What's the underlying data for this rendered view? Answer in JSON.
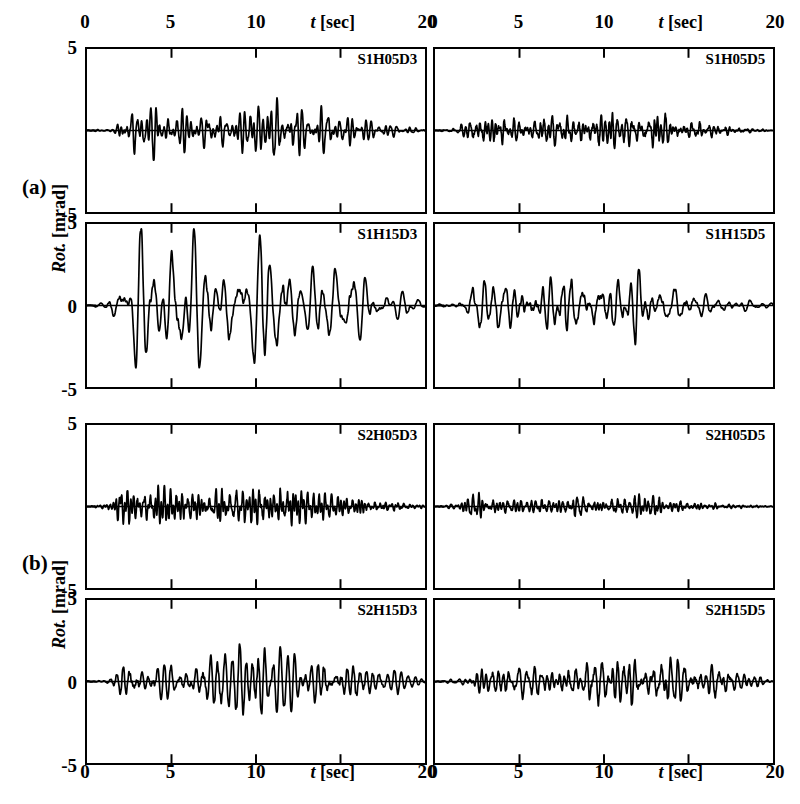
{
  "figure": {
    "width": 800,
    "height": 804,
    "background": "#ffffff",
    "ink_color": "#000000"
  },
  "groups": [
    {
      "id": "a",
      "label": "(a)",
      "x": 22,
      "y": 177
    },
    {
      "id": "b",
      "label": "(b)",
      "x": 22,
      "y": 553
    }
  ],
  "axis_titles": {
    "x_symbol": "t",
    "x_unit": "[sec]",
    "y_symbol": "Rot.",
    "y_unit": "[mrad]"
  },
  "axes": {
    "xlim": [
      0,
      20
    ],
    "ylim": [
      -5,
      5
    ],
    "x_ticks": [
      0,
      5,
      10,
      15,
      20
    ],
    "x_tick_labels": [
      "0",
      "5",
      "10",
      "",
      "20"
    ],
    "y_ticks": [
      -5,
      0,
      5
    ],
    "y_tick_labels_left_row1": [
      "5",
      "",
      "-5"
    ],
    "y_tick_labels_left_row2": [
      "5",
      "0",
      "-5"
    ],
    "y_tick_labels_right": [
      "",
      "",
      ""
    ],
    "grid": false
  },
  "layout": {
    "col_x": [
      85,
      433
    ],
    "col_width": 342,
    "row_y": [
      47,
      222,
      423,
      598
    ],
    "row_height": 167,
    "top_axis_y": 12,
    "bottom_axis_y": 762
  },
  "chart_data": {
    "type": "line",
    "title": "",
    "xlabel": "t [sec]",
    "ylabel": "Rot. [mrad]",
    "xlim": [
      0,
      20
    ],
    "ylim": [
      -5,
      5
    ],
    "grid": false,
    "legend_position": "none",
    "panels": [
      {
        "name": "S1H05D3",
        "group": "a",
        "row": 0,
        "col": 0,
        "series_name": "S1H05D3",
        "peak_amplitude": 2.0,
        "dominant_period_sec": 0.3,
        "envelope": [
          [
            0.0,
            0.02
          ],
          [
            1.5,
            0.05
          ],
          [
            2.0,
            0.55
          ],
          [
            2.6,
            0.95
          ],
          [
            3.2,
            0.7
          ],
          [
            3.8,
            0.95
          ],
          [
            4.4,
            0.6
          ],
          [
            5.2,
            0.55
          ],
          [
            6.0,
            0.65
          ],
          [
            6.8,
            0.55
          ],
          [
            7.6,
            0.7
          ],
          [
            8.4,
            0.5
          ],
          [
            9.0,
            0.75
          ],
          [
            9.8,
            0.85
          ],
          [
            10.6,
            0.65
          ],
          [
            11.2,
            0.9
          ],
          [
            11.8,
            0.65
          ],
          [
            12.6,
            0.8
          ],
          [
            13.4,
            0.6
          ],
          [
            14.2,
            0.75
          ],
          [
            15.0,
            0.45
          ],
          [
            16.0,
            0.35
          ],
          [
            17.0,
            0.25
          ],
          [
            18.0,
            0.18
          ],
          [
            19.0,
            0.12
          ],
          [
            20.0,
            0.06
          ]
        ],
        "seed": 11
      },
      {
        "name": "S1H05D5",
        "group": "a",
        "row": 0,
        "col": 1,
        "series_name": "S1H05D5",
        "peak_amplitude": 1.1,
        "dominant_period_sec": 0.28,
        "envelope": [
          [
            0.0,
            0.02
          ],
          [
            1.2,
            0.08
          ],
          [
            2.0,
            0.45
          ],
          [
            2.8,
            0.75
          ],
          [
            3.4,
            0.55
          ],
          [
            4.0,
            0.85
          ],
          [
            4.8,
            0.45
          ],
          [
            5.6,
            0.5
          ],
          [
            6.4,
            0.6
          ],
          [
            7.2,
            0.55
          ],
          [
            8.0,
            0.6
          ],
          [
            8.8,
            0.55
          ],
          [
            9.6,
            0.8
          ],
          [
            10.4,
            0.7
          ],
          [
            11.2,
            0.75
          ],
          [
            12.0,
            0.6
          ],
          [
            12.8,
            0.85
          ],
          [
            13.6,
            0.55
          ],
          [
            14.4,
            0.5
          ],
          [
            15.2,
            0.4
          ],
          [
            16.2,
            0.28
          ],
          [
            17.2,
            0.18
          ],
          [
            18.2,
            0.12
          ],
          [
            19.2,
            0.08
          ],
          [
            20.0,
            0.04
          ]
        ],
        "seed": 23
      },
      {
        "name": "S1H15D3",
        "group": "a",
        "row": 1,
        "col": 0,
        "series_name": "S1H15D3",
        "peak_amplitude": 4.7,
        "dominant_period_sec": 0.72,
        "envelope": [
          [
            0.0,
            0.02
          ],
          [
            0.8,
            0.06
          ],
          [
            1.4,
            0.18
          ],
          [
            2.0,
            0.3
          ],
          [
            2.6,
            0.62
          ],
          [
            3.2,
            0.78
          ],
          [
            3.8,
            0.98
          ],
          [
            4.4,
            0.85
          ],
          [
            5.0,
            0.72
          ],
          [
            5.6,
            0.8
          ],
          [
            6.2,
            0.7
          ],
          [
            6.8,
            0.58
          ],
          [
            7.4,
            0.6
          ],
          [
            8.0,
            0.62
          ],
          [
            8.6,
            0.66
          ],
          [
            9.2,
            0.78
          ],
          [
            9.8,
            0.8
          ],
          [
            10.4,
            0.92
          ],
          [
            11.0,
            0.84
          ],
          [
            11.6,
            0.78
          ],
          [
            12.2,
            0.58
          ],
          [
            12.8,
            0.4
          ],
          [
            13.4,
            0.62
          ],
          [
            14.0,
            0.7
          ],
          [
            14.6,
            0.6
          ],
          [
            15.2,
            0.52
          ],
          [
            15.8,
            0.48
          ],
          [
            16.4,
            0.4
          ],
          [
            17.2,
            0.3
          ],
          [
            18.0,
            0.22
          ],
          [
            19.0,
            0.14
          ],
          [
            20.0,
            0.07
          ]
        ],
        "seed": 7
      },
      {
        "name": "S1H15D5",
        "group": "a",
        "row": 1,
        "col": 1,
        "series_name": "S1H15D5",
        "peak_amplitude": 2.4,
        "dominant_period_sec": 0.62,
        "envelope": [
          [
            0.0,
            0.02
          ],
          [
            1.0,
            0.08
          ],
          [
            1.8,
            0.2
          ],
          [
            2.4,
            0.48
          ],
          [
            3.0,
            0.62
          ],
          [
            3.6,
            0.72
          ],
          [
            4.2,
            0.55
          ],
          [
            4.8,
            0.48
          ],
          [
            5.4,
            0.62
          ],
          [
            6.0,
            0.68
          ],
          [
            6.6,
            0.6
          ],
          [
            7.2,
            0.72
          ],
          [
            7.8,
            0.88
          ],
          [
            8.4,
            0.62
          ],
          [
            9.0,
            0.55
          ],
          [
            9.6,
            0.7
          ],
          [
            10.2,
            0.62
          ],
          [
            10.8,
            0.52
          ],
          [
            11.4,
            0.58
          ],
          [
            12.0,
            0.76
          ],
          [
            12.6,
            0.55
          ],
          [
            13.2,
            0.38
          ],
          [
            13.8,
            0.42
          ],
          [
            14.4,
            0.38
          ],
          [
            15.2,
            0.3
          ],
          [
            16.0,
            0.24
          ],
          [
            17.0,
            0.18
          ],
          [
            18.0,
            0.12
          ],
          [
            19.0,
            0.08
          ],
          [
            20.0,
            0.04
          ]
        ],
        "seed": 31
      },
      {
        "name": "S2H05D3",
        "group": "b",
        "row": 0,
        "col": 0,
        "series_name": "S2H05D3",
        "peak_amplitude": 1.3,
        "dominant_period_sec": 0.26,
        "envelope": [
          [
            0.0,
            0.02
          ],
          [
            1.4,
            0.1
          ],
          [
            2.0,
            0.6
          ],
          [
            2.6,
            0.72
          ],
          [
            3.2,
            0.48
          ],
          [
            3.8,
            0.55
          ],
          [
            4.6,
            0.5
          ],
          [
            5.4,
            0.62
          ],
          [
            6.2,
            0.55
          ],
          [
            7.0,
            0.48
          ],
          [
            7.8,
            0.58
          ],
          [
            8.6,
            0.52
          ],
          [
            9.4,
            0.7
          ],
          [
            10.0,
            0.62
          ],
          [
            10.8,
            0.58
          ],
          [
            11.6,
            0.62
          ],
          [
            12.4,
            0.88
          ],
          [
            13.0,
            0.55
          ],
          [
            13.8,
            0.48
          ],
          [
            14.6,
            0.38
          ],
          [
            15.4,
            0.3
          ],
          [
            16.4,
            0.24
          ],
          [
            17.4,
            0.18
          ],
          [
            18.4,
            0.12
          ],
          [
            19.4,
            0.08
          ],
          [
            20.0,
            0.04
          ]
        ],
        "seed": 53
      },
      {
        "name": "S2H05D5",
        "group": "b",
        "row": 0,
        "col": 1,
        "series_name": "S2H05D5",
        "peak_amplitude": 0.85,
        "dominant_period_sec": 0.25,
        "envelope": [
          [
            0.0,
            0.02
          ],
          [
            1.2,
            0.12
          ],
          [
            1.9,
            0.55
          ],
          [
            2.5,
            0.7
          ],
          [
            3.2,
            0.4
          ],
          [
            4.0,
            0.42
          ],
          [
            4.8,
            0.45
          ],
          [
            5.6,
            0.38
          ],
          [
            6.4,
            0.42
          ],
          [
            7.2,
            0.4
          ],
          [
            8.0,
            0.52
          ],
          [
            8.8,
            0.62
          ],
          [
            9.6,
            0.55
          ],
          [
            10.4,
            0.5
          ],
          [
            11.2,
            0.58
          ],
          [
            12.0,
            0.72
          ],
          [
            12.8,
            0.52
          ],
          [
            13.6,
            0.4
          ],
          [
            14.4,
            0.3
          ],
          [
            15.4,
            0.22
          ],
          [
            16.4,
            0.16
          ],
          [
            17.4,
            0.12
          ],
          [
            18.4,
            0.08
          ],
          [
            19.4,
            0.05
          ],
          [
            20.0,
            0.03
          ]
        ],
        "seed": 67
      },
      {
        "name": "S2H15D3",
        "group": "b",
        "row": 1,
        "col": 0,
        "series_name": "S2H15D3",
        "peak_amplitude": 2.3,
        "dominant_period_sec": 0.44,
        "envelope": [
          [
            0.0,
            0.02
          ],
          [
            1.0,
            0.06
          ],
          [
            1.8,
            0.18
          ],
          [
            2.3,
            0.52
          ],
          [
            2.9,
            0.6
          ],
          [
            3.5,
            0.32
          ],
          [
            4.1,
            0.45
          ],
          [
            4.7,
            0.5
          ],
          [
            5.3,
            0.35
          ],
          [
            5.9,
            0.42
          ],
          [
            6.5,
            0.58
          ],
          [
            7.1,
            0.62
          ],
          [
            7.7,
            0.55
          ],
          [
            8.3,
            0.68
          ],
          [
            8.9,
            0.88
          ],
          [
            9.5,
            0.8
          ],
          [
            10.1,
            0.72
          ],
          [
            10.7,
            0.78
          ],
          [
            11.3,
            0.7
          ],
          [
            11.9,
            0.58
          ],
          [
            12.5,
            0.48
          ],
          [
            13.1,
            0.42
          ],
          [
            13.7,
            0.55
          ],
          [
            14.3,
            0.82
          ],
          [
            14.9,
            0.55
          ],
          [
            15.5,
            0.42
          ],
          [
            16.2,
            0.38
          ],
          [
            17.0,
            0.32
          ],
          [
            17.8,
            0.28
          ],
          [
            18.6,
            0.2
          ],
          [
            19.4,
            0.12
          ],
          [
            20.0,
            0.05
          ]
        ],
        "seed": 83
      },
      {
        "name": "S2H15D5",
        "group": "b",
        "row": 1,
        "col": 1,
        "series_name": "S2H15D5",
        "peak_amplitude": 1.5,
        "dominant_period_sec": 0.4,
        "envelope": [
          [
            0.0,
            0.02
          ],
          [
            1.2,
            0.06
          ],
          [
            2.0,
            0.14
          ],
          [
            2.6,
            0.35
          ],
          [
            3.2,
            0.42
          ],
          [
            3.8,
            0.38
          ],
          [
            4.4,
            0.48
          ],
          [
            5.0,
            0.52
          ],
          [
            5.6,
            0.45
          ],
          [
            6.2,
            0.5
          ],
          [
            6.8,
            0.42
          ],
          [
            7.4,
            0.38
          ],
          [
            8.0,
            0.42
          ],
          [
            8.6,
            0.58
          ],
          [
            9.2,
            0.68
          ],
          [
            9.8,
            0.62
          ],
          [
            10.4,
            0.72
          ],
          [
            11.0,
            0.66
          ],
          [
            11.6,
            0.7
          ],
          [
            12.2,
            0.64
          ],
          [
            12.8,
            0.66
          ],
          [
            13.4,
            0.62
          ],
          [
            14.0,
            0.7
          ],
          [
            14.6,
            0.64
          ],
          [
            15.2,
            0.58
          ],
          [
            15.8,
            0.52
          ],
          [
            16.4,
            0.48
          ],
          [
            17.0,
            0.42
          ],
          [
            17.6,
            0.34
          ],
          [
            18.2,
            0.24
          ],
          [
            19.0,
            0.14
          ],
          [
            19.6,
            0.08
          ],
          [
            20.0,
            0.04
          ]
        ],
        "seed": 97
      }
    ]
  }
}
